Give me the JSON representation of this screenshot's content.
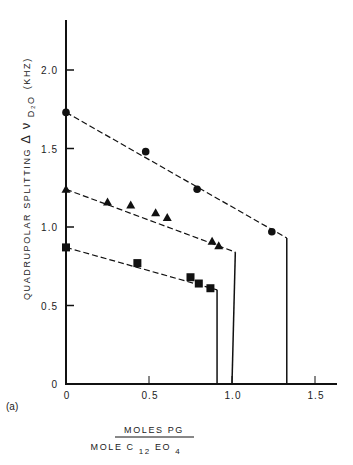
{
  "chart_data": {
    "type": "scatter",
    "panel_label": "(a)",
    "title": "",
    "xlabel": {
      "numerator": "MOLES PG",
      "denominator_prefix": "MOLE C",
      "denominator_sub1": "12",
      "denominator_mid": "EO",
      "denominator_sub2": "4"
    },
    "ylabel": {
      "prefix": "QUADRUPOLAR SPLITTING ",
      "delta": "Δ",
      "nu": "ν",
      "subscript": "D₂O",
      "unit": "(KHZ)"
    },
    "xlim": [
      0,
      1.6
    ],
    "ylim": [
      0,
      2.3
    ],
    "xticks": [
      0,
      0.5,
      1.0,
      1.5
    ],
    "xtick_labels": [
      "0",
      "0.5",
      "1.0",
      "1.5"
    ],
    "yticks": [
      0,
      0.5,
      1.0,
      1.5,
      2.0
    ],
    "ytick_labels": [
      "0",
      "0.5",
      "1.0",
      "1.5",
      "2.0"
    ],
    "grid": false,
    "legend": null,
    "series": [
      {
        "name": "circles",
        "marker": "circle",
        "points": [
          [
            0,
            1.73
          ],
          [
            0.48,
            1.48
          ],
          [
            0.79,
            1.24
          ],
          [
            1.24,
            0.97
          ]
        ],
        "fit_line": [
          [
            0,
            1.73
          ],
          [
            1.33,
            0.93
          ]
        ],
        "drop_line": [
          [
            1.33,
            0.93
          ],
          [
            1.33,
            0
          ]
        ]
      },
      {
        "name": "triangles",
        "marker": "triangle",
        "points": [
          [
            0,
            1.24
          ],
          [
            0.25,
            1.16
          ],
          [
            0.39,
            1.14
          ],
          [
            0.54,
            1.09
          ],
          [
            0.61,
            1.06
          ],
          [
            0.88,
            0.91
          ],
          [
            0.92,
            0.88
          ]
        ],
        "fit_line": [
          [
            0,
            1.24
          ],
          [
            1.02,
            0.84
          ]
        ],
        "drop_line": [
          [
            1.02,
            0.84
          ],
          [
            1.0,
            0
          ]
        ]
      },
      {
        "name": "squares",
        "marker": "square",
        "points": [
          [
            0,
            0.87
          ],
          [
            0.43,
            0.77
          ],
          [
            0.75,
            0.68
          ],
          [
            0.8,
            0.64
          ],
          [
            0.87,
            0.61
          ]
        ],
        "fit_line": [
          [
            0,
            0.87
          ],
          [
            0.91,
            0.6
          ]
        ],
        "drop_line": [
          [
            0.91,
            0.6
          ],
          [
            0.91,
            0
          ]
        ]
      }
    ]
  }
}
